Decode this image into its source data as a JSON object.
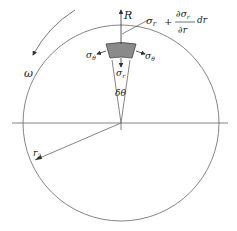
{
  "diagram": {
    "labels": {
      "R": "R",
      "sigma_r_top": "σ",
      "sigma_r_top_sub": "r",
      "plus": "+",
      "partial_num": "∂σ",
      "partial_num_sub": "r",
      "dr": "dr",
      "partial_den": "∂r",
      "sigma_theta_left": "σ",
      "sigma_theta_left_sub": "θ",
      "sigma_theta_right": "σ",
      "sigma_theta_right_sub": "θ",
      "sigma_r_bottom": "σ",
      "sigma_r_bottom_sub": "r",
      "delta_theta": "δθ",
      "omega": "ω",
      "r2": "r",
      "r2_sub": "2"
    },
    "colors": {
      "line": "#555555",
      "element_fill": "#8a8a8a",
      "text": "#222222"
    }
  }
}
